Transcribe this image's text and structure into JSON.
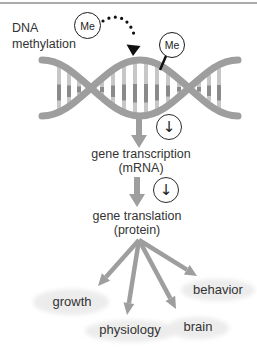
{
  "diagram": {
    "process_label": {
      "line1": "DNA",
      "line2": "methylation"
    },
    "methyl_groups": [
      {
        "label": "Me"
      },
      {
        "label": "Me"
      }
    ],
    "decrease_icon_glyph": "↓",
    "steps": [
      {
        "label": "gene transcription",
        "sublabel": "(mRNA)"
      },
      {
        "label": "gene translation",
        "sublabel": "(protein)"
      }
    ],
    "outcomes": [
      {
        "label": "growth"
      },
      {
        "label": "physiology"
      },
      {
        "label": "brain"
      },
      {
        "label": "behavior"
      }
    ],
    "colors": {
      "arrow_gray": "#9e9e9e",
      "rung_light": "#c7c7c7",
      "rung_dark": "#8a8a8a",
      "highlight_ellipse": "#ececec",
      "text": "#333333",
      "ink": "#111111"
    }
  }
}
